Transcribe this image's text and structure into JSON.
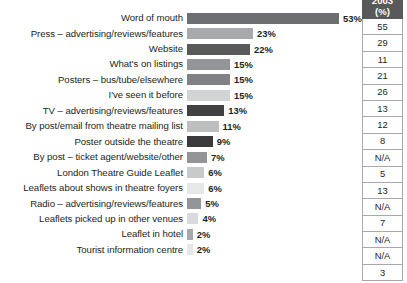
{
  "chart_data": {
    "type": "bar",
    "orientation": "horizontal",
    "title": "",
    "subtitle": "",
    "xlabel": "",
    "ylabel": "",
    "grid": false,
    "legend": "none",
    "xlim": [
      0,
      53
    ],
    "value_suffix": "%",
    "categories": [
      "Word of mouth",
      "Press – advertising/reviews/features",
      "Website",
      "What's on listings",
      "Posters – bus/tube/elsewhere",
      "I've seen it before",
      "TV – advertising/reviews/features",
      "By post/email from theatre mailing list",
      "Poster outside the theatre",
      "By post – ticket agent/website/other",
      "London Theatre Guide Leaflet",
      "Leaflets about shows in theatre foyers",
      "Radio – advertising/reviews/features",
      "Leaflets picked up in other venues",
      "Leaflet in hotel",
      "Tourist information centre"
    ],
    "values": [
      53,
      23,
      22,
      15,
      15,
      15,
      13,
      11,
      9,
      7,
      6,
      6,
      5,
      4,
      2,
      2
    ],
    "value_labels": [
      "53%",
      "23%",
      "22%",
      "15%",
      "15%",
      "15%",
      "13%",
      "11%",
      "9%",
      "7%",
      "6%",
      "6%",
      "5%",
      "4%",
      "2%",
      "2%"
    ],
    "bar_colors": [
      "#6d6e71",
      "#a7a9ac",
      "#58595b",
      "#939598",
      "#808285",
      "#d1d3d4",
      "#414042",
      "#bcbec0",
      "#3b3b3d",
      "#939598",
      "#c7c9cb",
      "#e6e7e8",
      "#939598",
      "#d9dadb",
      "#a7a9ac",
      "#e6e7e8"
    ],
    "side_table": {
      "header_lines": [
        "2003",
        "(%)"
      ],
      "values": [
        "55",
        "29",
        "11",
        "21",
        "26",
        "13",
        "12",
        "8",
        "N/A",
        "5",
        "13",
        "N/A",
        "7",
        "N/A",
        "N/A",
        "3"
      ]
    }
  }
}
